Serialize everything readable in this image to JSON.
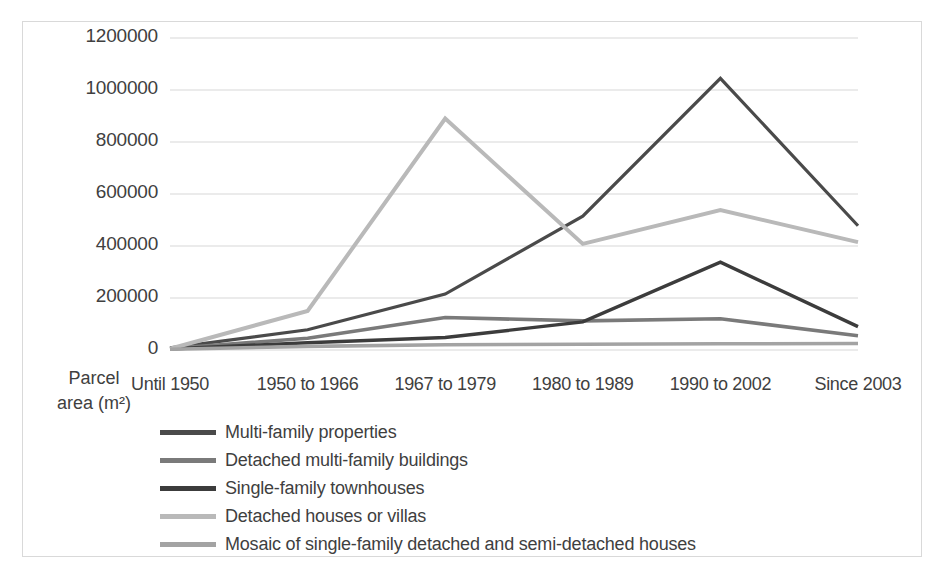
{
  "chart_data": {
    "type": "line",
    "title": "",
    "xlabel": "",
    "ylabel": "Parcel area (m²)",
    "ylabel_lines": [
      "Parcel",
      "area (m²)"
    ],
    "categories": [
      "Until 1950",
      "1950 to 1966",
      "1967 to 1979",
      "1980 to 1989",
      "1990 to 2002",
      "Since 2003"
    ],
    "ylim": [
      0,
      1200000
    ],
    "ytick_values": [
      0,
      200000,
      400000,
      600000,
      800000,
      1000000,
      1200000
    ],
    "ytick_labels": [
      "0",
      "200000",
      "400000",
      "600000",
      "800000",
      "1000000",
      "1200000"
    ],
    "grid": true,
    "legend_position": "bottom-left",
    "series": [
      {
        "name": "Multi-family properties",
        "color": "#4a4a4a",
        "width": 3.2,
        "values": [
          8000,
          78000,
          215000,
          515000,
          1045000,
          478000
        ]
      },
      {
        "name": "Detached multi-family buildings",
        "color": "#7a7a7a",
        "width": 3.6,
        "values": [
          6000,
          45000,
          125000,
          112000,
          120000,
          55000
        ]
      },
      {
        "name": "Single-family townhouses",
        "color": "#3c3c3c",
        "width": 3.4,
        "values": [
          4000,
          28000,
          48000,
          108000,
          338000,
          90000
        ]
      },
      {
        "name": "Detached houses or villas",
        "color": "#b9b9b9",
        "width": 4.0,
        "values": [
          5000,
          150000,
          890000,
          408000,
          538000,
          415000
        ]
      },
      {
        "name": "Mosaic of single-family detached and semi-detached houses",
        "color": "#a3a3a3",
        "width": 3.6,
        "values": [
          3000,
          14000,
          20000,
          22000,
          24000,
          25000
        ]
      }
    ],
    "plot_box": {
      "left": 170,
      "top": 38,
      "right": 858,
      "bottom": 350
    },
    "gridline_color": "#d7d7d7",
    "background": "#ffffff"
  }
}
